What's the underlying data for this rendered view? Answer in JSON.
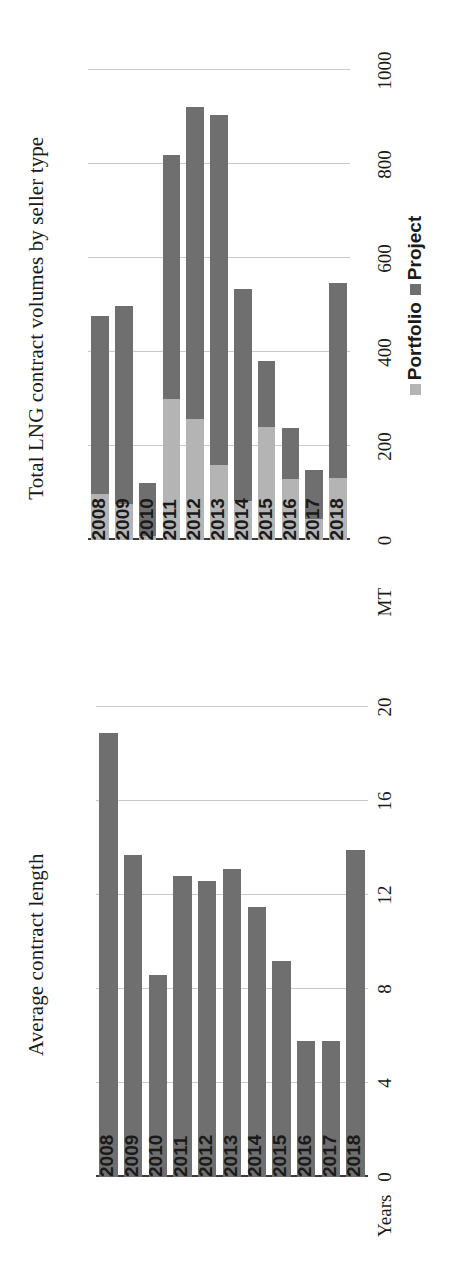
{
  "page": {
    "orientation": "rotated-90-ccw",
    "background": "#ffffff"
  },
  "colors": {
    "project": "#6f6f6f",
    "portfolio": "#b4b4b4",
    "gridline": "#c9c9c9",
    "axis": "#3a3a3a",
    "text": "#1a1a1a"
  },
  "left_panel": {
    "title": "Average contract length",
    "unit_label": "Years"
  },
  "right_panel": {
    "title": "Total LNG contract volumes by seller type",
    "unit_label": "MT",
    "legend": [
      {
        "label": "Portfolio",
        "color": "#b4b4b4"
      },
      {
        "label": "Project",
        "color": "#6f6f6f"
      }
    ]
  },
  "chart_data": [
    {
      "type": "bar",
      "title": "Average contract length",
      "xlabel": "",
      "ylabel": "Years",
      "ylim": [
        0,
        20
      ],
      "yticks": [
        0,
        4,
        8,
        12,
        16,
        20
      ],
      "grid": true,
      "orientation": "vertical",
      "categories": [
        "2008",
        "2009",
        "2010",
        "2011",
        "2012",
        "2013",
        "2014",
        "2015",
        "2016",
        "2017",
        "2018"
      ],
      "values": [
        18.9,
        13.7,
        8.6,
        12.8,
        12.6,
        13.1,
        11.5,
        9.2,
        5.8,
        5.8,
        13.9
      ],
      "legend_position": "none"
    },
    {
      "type": "bar",
      "title": "Total LNG contract volumes by seller type",
      "xlabel": "",
      "ylabel": "MT",
      "ylim": [
        0,
        1000
      ],
      "yticks": [
        0,
        200,
        400,
        600,
        800,
        1000
      ],
      "grid": true,
      "orientation": "vertical",
      "stacked": true,
      "categories": [
        "2008",
        "2009",
        "2010",
        "2011",
        "2012",
        "2013",
        "2014",
        "2015",
        "2016",
        "2017",
        "2018"
      ],
      "series": [
        {
          "name": "Portfolio",
          "color": "#b4b4b4",
          "values": [
            98,
            78,
            10,
            300,
            258,
            160,
            85,
            242,
            130,
            45,
            133
          ]
        },
        {
          "name": "Project",
          "color": "#6f6f6f",
          "values": [
            380,
            420,
            112,
            520,
            665,
            745,
            450,
            140,
            110,
            105,
            415
          ]
        }
      ],
      "totals": [
        478,
        498,
        122,
        820,
        923,
        905,
        535,
        382,
        240,
        150,
        548
      ],
      "legend_position": "bottom"
    }
  ]
}
